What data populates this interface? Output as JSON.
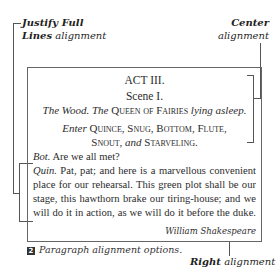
{
  "callouts": {
    "justify_full": {
      "bold": "Justify Full",
      "rest": ""
    },
    "lines_alignment": {
      "bold": "Lines",
      "rest": " alignment"
    },
    "center": {
      "bold": "Center",
      "rest": "alignment"
    },
    "right": {
      "bold": "Right",
      "rest": " alignment"
    }
  },
  "sample": {
    "act": "ACT III.",
    "scene": "Scene I.",
    "setting": {
      "part1": "The Wood. The ",
      "smallcaps": "Queen of Fairies",
      "part2": " lying asleep."
    },
    "enter": {
      "italic": "Enter ",
      "names1": "Quince, Snug, Bottom, Flute,",
      "names2a": "Snout, ",
      "and": "and ",
      "names2b": "Starveling."
    },
    "bot_speaker": "Bot.",
    "bot_line": " Are we all met?",
    "quin_speaker": "Quin.",
    "quin_line": " Pat, pat; and here is a marvellous convenient place for our rehearsal. This green plot shall be our stage, this hawthorn brake our tiring-house; and we will do it in action, as we will do it before the duke.",
    "author": "William Shakespeare"
  },
  "caption": {
    "number": "2",
    "text": "Paragraph alignment options."
  },
  "colors": {
    "line": "#555555",
    "text": "#2c2c2c",
    "badge": "#333333"
  }
}
